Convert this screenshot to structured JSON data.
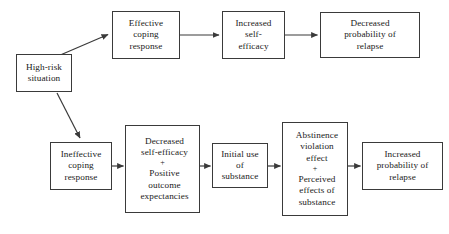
{
  "diagram": {
    "background_color": "#ffffff",
    "line_color": "#3a3a3a",
    "text_color": "#1a1a1a",
    "nodes": [
      {
        "id": "high-risk-situation",
        "label": "High-risk\nsituation",
        "x": 16,
        "y": 54,
        "w": 56,
        "h": 38
      },
      {
        "id": "effective-coping-response",
        "label": "Effective\ncoping\nresponse",
        "x": 112,
        "y": 11,
        "w": 68,
        "h": 48
      },
      {
        "id": "increased-self-efficacy",
        "label": "Increased\nself-\nefficacy",
        "x": 222,
        "y": 11,
        "w": 63,
        "h": 48
      },
      {
        "id": "decreased-probability-of-relapse",
        "label": "Decreased\nprobability of\nrelapse",
        "x": 320,
        "y": 12,
        "w": 100,
        "h": 46
      },
      {
        "id": "ineffective-coping-response",
        "label": "Ineffective\ncoping\nresponse",
        "x": 50,
        "y": 142,
        "w": 62,
        "h": 48
      },
      {
        "id": "decreased-self-efficacy-positive-outcome-expectancies",
        "label": "Decreased\nself-efficacy",
        "label_plus": "+",
        "label_second": "Positive\noutcome\nexpectancies",
        "x": 125,
        "y": 125,
        "w": 75,
        "h": 88
      },
      {
        "id": "initial-use-of-substance",
        "label": "Initial use\nof\nsubstance",
        "x": 212,
        "y": 143,
        "w": 56,
        "h": 45
      },
      {
        "id": "abstinence-violation-effect-perceived-effects",
        "label": "Abstinence\nviolation\neffect",
        "label_plus": "+",
        "label_second": "Perceived\neffects of\nsubstance",
        "x": 282,
        "y": 122,
        "w": 66,
        "h": 94
      },
      {
        "id": "increased-probability-of-relapse",
        "label": "Increased\nprobability of\nrelapse",
        "x": 362,
        "y": 142,
        "w": 81,
        "h": 48
      }
    ],
    "edges": [
      {
        "id": "high-risk-to-effective-coping",
        "from": "high-risk-situation",
        "to": "effective-coping-response",
        "type": "diagonal-up",
        "x1": 58,
        "y1": 56,
        "x2": 110,
        "y2": 34
      },
      {
        "id": "high-risk-to-ineffective-coping",
        "from": "high-risk-situation",
        "to": "ineffective-coping-response",
        "type": "diagonal-down",
        "x1": 57,
        "y1": 93,
        "x2": 81,
        "y2": 140
      },
      {
        "id": "effective-coping-to-increased-self-efficacy",
        "from": "effective-coping-response",
        "to": "increased-self-efficacy",
        "type": "horizontal",
        "x1": 180,
        "y1": 35,
        "x2": 220,
        "y2": 35
      },
      {
        "id": "increased-self-efficacy-to-decreased-probability",
        "from": "increased-self-efficacy",
        "to": "decreased-probability-of-relapse",
        "type": "horizontal",
        "x1": 285,
        "y1": 35,
        "x2": 318,
        "y2": 35
      },
      {
        "id": "ineffective-coping-to-decreased-self-efficacy",
        "from": "ineffective-coping-response",
        "to": "decreased-self-efficacy-positive-outcome-expectancies",
        "type": "horizontal",
        "x1": 112,
        "y1": 166,
        "x2": 123,
        "y2": 166
      },
      {
        "id": "decreased-self-efficacy-to-initial-use",
        "from": "decreased-self-efficacy-positive-outcome-expectancies",
        "to": "initial-use-of-substance",
        "type": "horizontal",
        "x1": 200,
        "y1": 166,
        "x2": 210,
        "y2": 166
      },
      {
        "id": "initial-use-to-abstinence-violation",
        "from": "initial-use-of-substance",
        "to": "abstinence-violation-effect-perceived-effects",
        "type": "horizontal",
        "x1": 268,
        "y1": 166,
        "x2": 280,
        "y2": 166
      },
      {
        "id": "abstinence-violation-to-increased-probability",
        "from": "abstinence-violation-effect-perceived-effects",
        "to": "increased-probability-of-relapse",
        "type": "horizontal",
        "x1": 348,
        "y1": 166,
        "x2": 360,
        "y2": 166
      }
    ]
  }
}
